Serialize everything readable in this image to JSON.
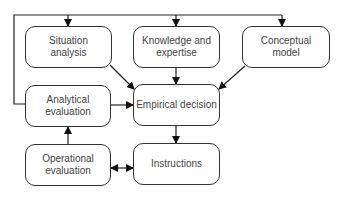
{
  "diagram": {
    "nodes": [
      {
        "id": "situation",
        "label": "Situation\nanalysis"
      },
      {
        "id": "knowledge",
        "label": "Knowledge and\nexpertise"
      },
      {
        "id": "conceptual",
        "label": "Conceptual\nmodel"
      },
      {
        "id": "analytical",
        "label": "Analytical\nevaluation"
      },
      {
        "id": "empirical",
        "label": "Empirical decision"
      },
      {
        "id": "operational",
        "label": "Operational\nevaluation"
      },
      {
        "id": "instructions",
        "label": "Instructions"
      }
    ],
    "edges": [
      {
        "from": "analytical",
        "to": "situation",
        "via": "feedback loop"
      },
      {
        "from": "analytical",
        "to": "knowledge",
        "via": "feedback loop"
      },
      {
        "from": "analytical",
        "to": "conceptual",
        "via": "feedback loop"
      },
      {
        "from": "situation",
        "to": "empirical"
      },
      {
        "from": "knowledge",
        "to": "empirical"
      },
      {
        "from": "conceptual",
        "to": "empirical"
      },
      {
        "from": "analytical",
        "to": "empirical"
      },
      {
        "from": "empirical",
        "to": "instructions"
      },
      {
        "from": "operational",
        "to": "analytical"
      },
      {
        "from": "operational",
        "to": "instructions",
        "bidirectional": true
      }
    ],
    "colors": {
      "line": "#222222",
      "text": "#444444",
      "box_border": "#333333"
    }
  }
}
